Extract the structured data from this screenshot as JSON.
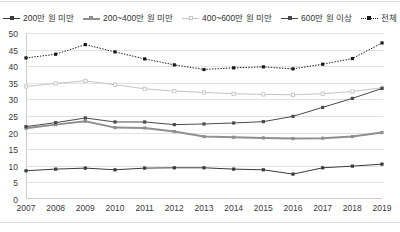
{
  "chart_data": {
    "type": "line",
    "title": "",
    "xlabel": "",
    "ylabel": "",
    "ylim": [
      0,
      50
    ],
    "ytick_step": 5,
    "yticks": [
      "50",
      "45",
      "40",
      "35",
      "30",
      "25",
      "20",
      "15",
      "10",
      "5",
      "0"
    ],
    "grid": true,
    "legend_position": "top",
    "categories": [
      "2007",
      "2008",
      "2009",
      "2010",
      "2011",
      "2012",
      "2013",
      "2014",
      "2015",
      "2016",
      "2017",
      "2018",
      "2019"
    ],
    "series": [
      {
        "name": "200만 원 미만",
        "color": "#3a3a3a",
        "line_style": "solid",
        "line_width": 1,
        "marker": "square-filled",
        "values": [
          8.5,
          9.0,
          9.3,
          8.8,
          9.3,
          9.4,
          9.4,
          9.0,
          8.8,
          7.5,
          9.4,
          9.9,
          10.5
        ]
      },
      {
        "name": "200~400만 원 미만",
        "color": "#8f8f8f",
        "line_style": "solid",
        "line_width": 2,
        "marker": "square-filled",
        "values": [
          21.3,
          22.4,
          23.4,
          21.5,
          21.4,
          20.3,
          18.8,
          18.6,
          18.4,
          18.2,
          18.3,
          18.8,
          20.0
        ]
      },
      {
        "name": "400~600만 원 미만",
        "color": "#c4c4c4",
        "line_style": "solid",
        "line_width": 1,
        "marker": "square-open",
        "values": [
          33.9,
          34.8,
          35.6,
          34.4,
          33.2,
          32.5,
          32.1,
          31.7,
          31.5,
          31.4,
          31.7,
          32.4,
          33.5
        ]
      },
      {
        "name": "600만 원 이상",
        "color": "#4a4a4a",
        "line_style": "solid",
        "line_width": 1,
        "marker": "square-filled",
        "values": [
          21.8,
          23.0,
          24.4,
          23.2,
          23.2,
          22.4,
          22.6,
          22.9,
          23.3,
          24.9,
          27.6,
          30.3,
          33.3
        ]
      },
      {
        "name": "전체",
        "color": "#1a1a1a",
        "line_style": "dotted",
        "line_width": 1,
        "marker": "square-filled",
        "values": [
          42.5,
          43.6,
          46.5,
          44.3,
          42.2,
          40.4,
          39.0,
          39.5,
          39.8,
          39.2,
          40.6,
          42.3,
          47.0
        ]
      }
    ]
  }
}
